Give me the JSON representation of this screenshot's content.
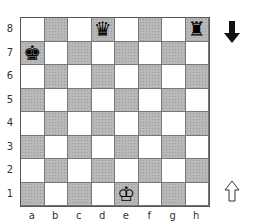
{
  "board": {
    "files": [
      "a",
      "b",
      "c",
      "d",
      "e",
      "f",
      "g",
      "h"
    ],
    "ranks": [
      "8",
      "7",
      "6",
      "5",
      "4",
      "3",
      "2",
      "1"
    ],
    "colors": {
      "light": "#ffffff",
      "dark": "#b8b8b8"
    },
    "pieces": [
      {
        "square": "d8",
        "piece": "black-queen",
        "glyph": "♛"
      },
      {
        "square": "h8",
        "piece": "black-rook",
        "glyph": "♜"
      },
      {
        "square": "a7",
        "piece": "black-king",
        "glyph": "♚"
      },
      {
        "square": "e1",
        "piece": "white-king",
        "glyph": "♔"
      }
    ]
  },
  "side_to_move": {
    "black_indicator": "filled-down-arrow",
    "white_indicator": "outline-up-arrow"
  }
}
